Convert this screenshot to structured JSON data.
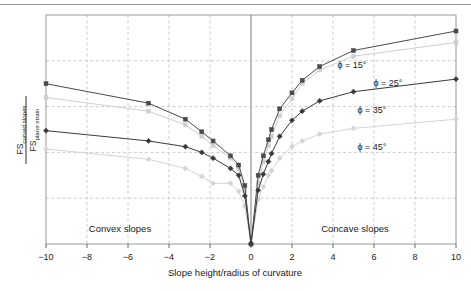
{
  "figure": {
    "background_color": "#ffffff",
    "top_rule_color": "#9a9a9a",
    "frame_color": "#8d8d8d",
    "grid_color": "#bfbfbf"
  },
  "axis": {
    "x_title": "Slope height/radius of curvature",
    "x_ticks": [
      "−10",
      "−8",
      "−6",
      "−4",
      "−2",
      "0",
      "2",
      "4",
      "6",
      "8",
      "10"
    ],
    "x_tick_values": [
      -10,
      -8,
      -6,
      -4,
      -2,
      0,
      2,
      4,
      6,
      8,
      10
    ],
    "y_title_numerator": "FS",
    "y_title_numerator_sub": "curved slopes",
    "y_title_denominator": "FS",
    "y_title_denominator_sub": "plane strain"
  },
  "annotations": {
    "convex": "Convex slopes",
    "concave": "Concave slopes"
  },
  "series_labels": {
    "phi15": "ϕ = 15°",
    "phi25": "ϕ = 25°",
    "phi35": "ϕ = 35°",
    "phi45": "ϕ = 45°"
  },
  "chart_data": {
    "type": "line",
    "title": "",
    "xlabel": "Slope height/radius of curvature",
    "ylabel": "FScurved slopes / FSplane strain",
    "xlim": [
      -10,
      10
    ],
    "ylim": [
      0,
      1
    ],
    "grid": true,
    "legend_position": "inline-annotations",
    "x_ticks": [
      -10,
      -8,
      -6,
      -4,
      -2,
      0,
      2,
      4,
      6,
      8,
      10
    ],
    "y_ticks_unlabeled": true,
    "annotations": [
      "Convex slopes",
      "Concave slopes"
    ],
    "series": [
      {
        "name": "ϕ = 15°",
        "color": "#4a4a4a",
        "marker": "square",
        "points": [
          [
            -10.0,
            0.7
          ],
          [
            -5.0,
            0.615
          ],
          [
            -3.2,
            0.545
          ],
          [
            -2.4,
            0.49
          ],
          [
            -1.85,
            0.45
          ],
          [
            -1.0,
            0.385
          ],
          [
            -0.6,
            0.345
          ],
          [
            -0.3,
            0.255
          ],
          [
            0.0,
            0.0
          ],
          [
            0.35,
            0.3
          ],
          [
            0.6,
            0.385
          ],
          [
            0.85,
            0.455
          ],
          [
            1.0,
            0.5
          ],
          [
            1.4,
            0.59
          ],
          [
            2.0,
            0.66
          ],
          [
            2.5,
            0.715
          ],
          [
            3.35,
            0.775
          ],
          [
            5.0,
            0.845
          ],
          [
            10.0,
            0.93
          ]
        ]
      },
      {
        "name": "ϕ = 25°",
        "color": "#cfcfcf",
        "marker": "square",
        "points": [
          [
            -10.0,
            0.64
          ],
          [
            -5.0,
            0.58
          ],
          [
            -3.2,
            0.52
          ],
          [
            -2.4,
            0.47
          ],
          [
            -1.85,
            0.43
          ],
          [
            -1.0,
            0.375
          ],
          [
            -0.6,
            0.33
          ],
          [
            -0.3,
            0.235
          ],
          [
            0.0,
            0.0
          ],
          [
            0.35,
            0.265
          ],
          [
            0.6,
            0.36
          ],
          [
            0.85,
            0.43
          ],
          [
            1.0,
            0.47
          ],
          [
            1.4,
            0.56
          ],
          [
            2.0,
            0.635
          ],
          [
            2.5,
            0.7
          ],
          [
            3.35,
            0.76
          ],
          [
            5.0,
            0.82
          ],
          [
            10.0,
            0.88
          ]
        ]
      },
      {
        "name": "ϕ = 35°",
        "color": "#3a3a3a",
        "marker": "diamond",
        "points": [
          [
            -10.0,
            0.495
          ],
          [
            -5.0,
            0.45
          ],
          [
            -3.2,
            0.425
          ],
          [
            -2.4,
            0.4
          ],
          [
            -1.85,
            0.375
          ],
          [
            -1.0,
            0.33
          ],
          [
            -0.6,
            0.3
          ],
          [
            -0.3,
            0.21
          ],
          [
            0.0,
            0.0
          ],
          [
            0.35,
            0.235
          ],
          [
            0.6,
            0.305
          ],
          [
            0.85,
            0.36
          ],
          [
            1.0,
            0.395
          ],
          [
            1.4,
            0.47
          ],
          [
            2.0,
            0.54
          ],
          [
            2.5,
            0.58
          ],
          [
            3.35,
            0.625
          ],
          [
            5.0,
            0.665
          ],
          [
            10.0,
            0.72
          ]
        ]
      },
      {
        "name": "ϕ = 45°",
        "color": "#d4d4d4",
        "marker": "diamond",
        "points": [
          [
            -10.0,
            0.415
          ],
          [
            -5.0,
            0.37
          ],
          [
            -3.2,
            0.33
          ],
          [
            -2.4,
            0.295
          ],
          [
            -1.85,
            0.265
          ],
          [
            -1.0,
            0.265
          ],
          [
            -0.6,
            0.23
          ],
          [
            -0.3,
            0.165
          ],
          [
            0.0,
            0.0
          ],
          [
            0.35,
            0.195
          ],
          [
            0.6,
            0.25
          ],
          [
            0.85,
            0.3
          ],
          [
            1.0,
            0.32
          ],
          [
            1.4,
            0.375
          ],
          [
            2.0,
            0.425
          ],
          [
            2.5,
            0.45
          ],
          [
            3.35,
            0.48
          ],
          [
            5.0,
            0.505
          ],
          [
            10.0,
            0.545
          ]
        ]
      }
    ]
  }
}
